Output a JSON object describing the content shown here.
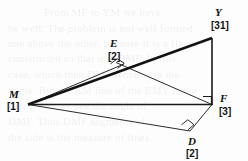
{
  "figure": {
    "canvas": {
      "width": 248,
      "height": 161
    },
    "colors": {
      "background": "#fdfdfd",
      "stroke": "#1a1a1a",
      "thin_stroke": "#3a3a3a",
      "text": "#121212",
      "bleed_text": "#6d6d75"
    },
    "vertices": [
      {
        "id": "M",
        "label": "M",
        "value": "[1]",
        "x": 28,
        "y": 104,
        "label_x": 9,
        "label_y": 89,
        "value_x": 7,
        "value_y": 102
      },
      {
        "id": "E",
        "label": "E",
        "value": "[2]",
        "x": 122,
        "y": 68,
        "label_x": 110,
        "label_y": 38,
        "value_x": 108,
        "value_y": 52
      },
      {
        "id": "Y",
        "label": "Y",
        "value": "[31]",
        "x": 212,
        "y": 38,
        "label_x": 215,
        "label_y": 7,
        "value_x": 211,
        "value_y": 21
      },
      {
        "id": "F",
        "label": "F",
        "value": "[3]",
        "x": 212,
        "y": 104,
        "label_x": 220,
        "label_y": 93,
        "value_x": 219,
        "value_y": 107
      },
      {
        "id": "D",
        "label": "D",
        "value": "[2]",
        "x": 190,
        "y": 131,
        "label_x": 188,
        "label_y": 136,
        "value_x": 186,
        "value_y": 149
      }
    ],
    "segments": [
      {
        "name": "segment-m-y",
        "from": "M",
        "to": "Y",
        "weight": "thick"
      },
      {
        "name": "segment-y-f",
        "from": "Y",
        "to": "F",
        "weight": "medium"
      },
      {
        "name": "segment-m-f",
        "from": "M",
        "to": "F",
        "weight": "medium"
      },
      {
        "name": "segment-m-e",
        "from": "M",
        "to": "E",
        "weight": "thin"
      },
      {
        "name": "segment-e-f",
        "from": "E",
        "to": "F",
        "weight": "thin"
      },
      {
        "name": "segment-m-d",
        "from": "M",
        "to": "D",
        "weight": "thin"
      },
      {
        "name": "segment-d-f",
        "from": "D",
        "to": "F",
        "weight": "thin"
      }
    ],
    "right_angle_marks": [
      {
        "name": "right-angle-at-e",
        "at": "E"
      },
      {
        "name": "right-angle-at-f",
        "at": "F"
      },
      {
        "name": "right-angle-at-d",
        "at": "D"
      }
    ],
    "labels": {
      "m_name": "M",
      "m_value": "[1]",
      "e_name": "E",
      "e_value": "[2]",
      "y_name": "Y",
      "y_value": "[31]",
      "f_name": "F",
      "f_value": "[3]",
      "d_name": "D",
      "d_value": "[2]"
    }
  },
  "background_bleed": {
    "lines": [
      {
        "text": "From MF to YM we have",
        "x": 44,
        "y": 12
      },
      {
        "text": "be well. The problem is not well formed",
        "x": 8,
        "y": 28
      },
      {
        "text": "one above the other, because it is a figure",
        "x": 8,
        "y": 43
      },
      {
        "text": "constructed so that it is DMF. In this",
        "x": 8,
        "y": 58
      },
      {
        "text": "case, which then DMF remains in the",
        "x": 8,
        "y": 74
      },
      {
        "text": "angle. But the EM line of the EMY is the",
        "x": 8,
        "y": 90
      },
      {
        "text": "triangle as we see the angle of",
        "x": 8,
        "y": 105
      },
      {
        "text": "DMF. Thus DMF segments of",
        "x": 8,
        "y": 121
      },
      {
        "text": "the side is the measure of lines",
        "x": 8,
        "y": 137
      }
    ]
  }
}
